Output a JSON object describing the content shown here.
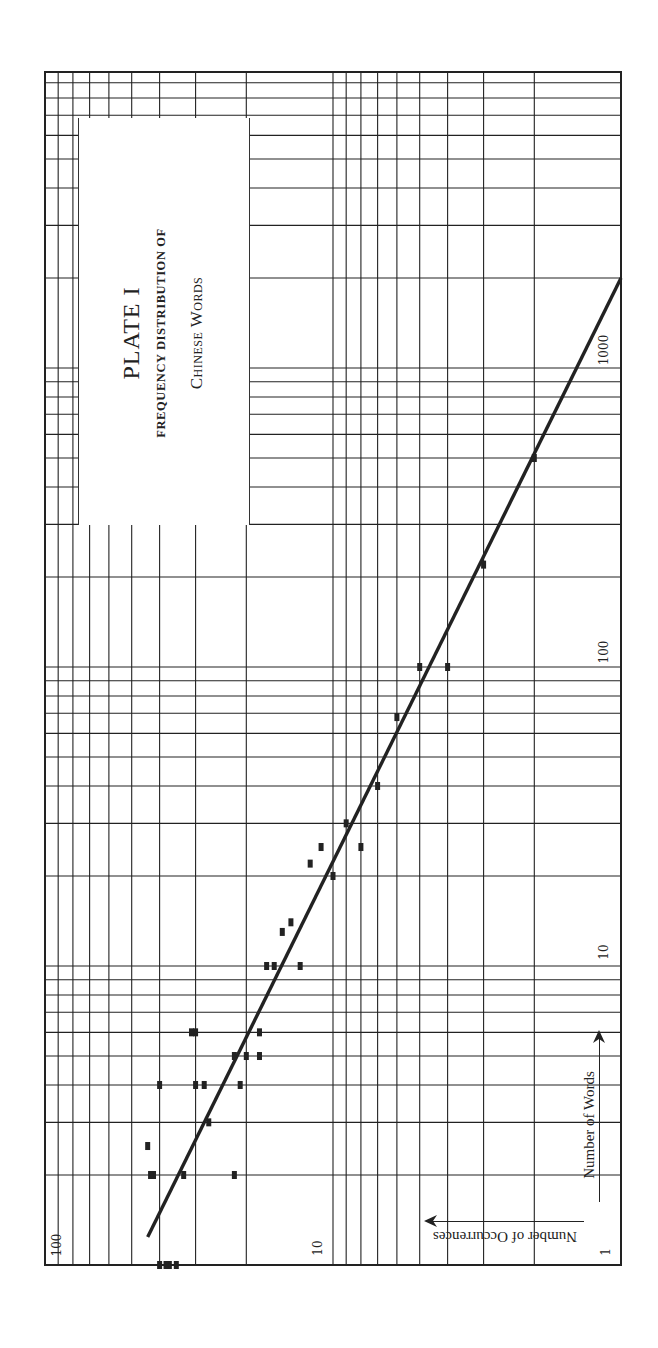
{
  "plate": {
    "title": "PLATE I",
    "subtitle_line1": "FREQUENCY DISTRIBUTION OF",
    "subtitle_line2": "Chinese Words"
  },
  "axes": {
    "occurrences_label": "Number of Occurrences",
    "words_label": "Number of Words",
    "occurrence_ticks": [
      "100",
      "10",
      "1"
    ],
    "word_ticks": [
      "10",
      "100",
      "1000"
    ]
  },
  "colors": {
    "ink": "#222222",
    "paper": "#ffffff"
  },
  "chart_data": {
    "type": "scatter",
    "orientation": "page rotated 90° counter-clockwise; occurrences increase leftward, words increase upward",
    "xlabel": "Number of Occurrences",
    "ylabel": "Number of Words",
    "xscale": "log",
    "yscale": "log",
    "xlim": [
      1,
      100
    ],
    "ylim": [
      1,
      10000
    ],
    "x_tick_labels": [
      "1",
      "10",
      "100"
    ],
    "y_tick_labels": [
      "1",
      "10",
      "100",
      "1000"
    ],
    "grid": true,
    "legend": null,
    "series": [
      {
        "name": "Observed words",
        "marker": "square",
        "points": [
          {
            "occurrences": 2,
            "words": 500
          },
          {
            "occurrences": 3,
            "words": 220
          },
          {
            "occurrences": 4,
            "words": 100
          },
          {
            "occurrences": 5,
            "words": 100
          },
          {
            "occurrences": 6,
            "words": 68
          },
          {
            "occurrences": 7,
            "words": 40
          },
          {
            "occurrences": 9,
            "words": 30
          },
          {
            "occurrences": 8,
            "words": 25
          },
          {
            "occurrences": 11,
            "words": 25
          },
          {
            "occurrences": 12,
            "words": 22
          },
          {
            "occurrences": 10,
            "words": 20
          },
          {
            "occurrences": 14,
            "words": 14
          },
          {
            "occurrences": 15,
            "words": 13
          },
          {
            "occurrences": 13,
            "words": 10
          },
          {
            "occurrences": 16,
            "words": 10
          },
          {
            "occurrences": 17,
            "words": 10
          },
          {
            "occurrences": 18,
            "words": 6
          },
          {
            "occurrences": 30,
            "words": 6
          },
          {
            "occurrences": 31,
            "words": 6
          },
          {
            "occurrences": 18,
            "words": 5
          },
          {
            "occurrences": 20,
            "words": 5
          },
          {
            "occurrences": 22,
            "words": 5
          },
          {
            "occurrences": 21,
            "words": 4
          },
          {
            "occurrences": 28,
            "words": 4
          },
          {
            "occurrences": 30,
            "words": 4
          },
          {
            "occurrences": 40,
            "words": 4
          },
          {
            "occurrences": 27,
            "words": 3
          },
          {
            "occurrences": 44,
            "words": 2.5
          },
          {
            "occurrences": 22,
            "words": 2
          },
          {
            "occurrences": 33,
            "words": 2
          },
          {
            "occurrences": 42,
            "words": 2
          },
          {
            "occurrences": 43,
            "words": 2
          },
          {
            "occurrences": 35,
            "words": 1
          },
          {
            "occurrences": 37,
            "words": 1
          },
          {
            "occurrences": 38,
            "words": 1
          },
          {
            "occurrences": 40,
            "words": 1
          }
        ]
      },
      {
        "name": "Fitted line",
        "type": "line",
        "points": [
          {
            "occurrences": 44,
            "words": 1.24
          },
          {
            "occurrences": 1,
            "words": 2000
          }
        ]
      }
    ]
  }
}
